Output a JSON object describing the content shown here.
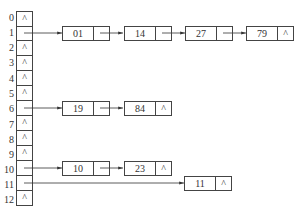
{
  "indices": [
    "0",
    "1",
    "2",
    "3",
    "4",
    "5",
    "6",
    "7",
    "8",
    "9",
    "10",
    "11",
    "12"
  ],
  "null_symbol": "^",
  "buckets": [
    {
      "index": "0",
      "chain": []
    },
    {
      "index": "1",
      "chain": [
        "01",
        "14",
        "27",
        "79"
      ]
    },
    {
      "index": "2",
      "chain": []
    },
    {
      "index": "3",
      "chain": []
    },
    {
      "index": "4",
      "chain": []
    },
    {
      "index": "5",
      "chain": []
    },
    {
      "index": "6",
      "chain": [
        "19",
        "84"
      ]
    },
    {
      "index": "7",
      "chain": []
    },
    {
      "index": "8",
      "chain": []
    },
    {
      "index": "9",
      "chain": []
    },
    {
      "index": "10",
      "chain": [
        "10",
        "23"
      ]
    },
    {
      "index": "11",
      "chain": [
        "11"
      ]
    },
    {
      "index": "12",
      "chain": []
    }
  ],
  "nodes": {
    "n1_0": "01",
    "n1_1": "14",
    "n1_2": "27",
    "n1_3": "79",
    "n6_0": "19",
    "n6_1": "84",
    "n10_0": "10",
    "n10_1": "23",
    "n11_0": "11"
  }
}
